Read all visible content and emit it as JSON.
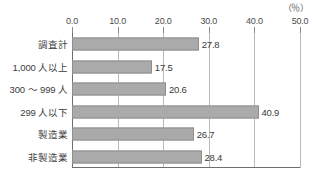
{
  "chart_data": {
    "type": "bar",
    "orientation": "horizontal",
    "title": "",
    "xlabel": "",
    "ylabel": "",
    "unit_label": "（％）",
    "xlim": [
      0.0,
      50.0
    ],
    "xticks": [
      "0.0",
      "10.0",
      "20.0",
      "30.0",
      "40.0",
      "50.0"
    ],
    "xtick_values": [
      0,
      10,
      20,
      30,
      40,
      50
    ],
    "grid": true,
    "legend": false,
    "categories": [
      "調査計",
      "1,000 人以上",
      "300 ～ 999 人",
      "299 人以下",
      "製造業",
      "非製造業"
    ],
    "values": [
      27.8,
      17.5,
      20.6,
      40.9,
      26.7,
      28.4
    ],
    "value_labels": [
      "27.8",
      "17.5",
      "20.6",
      "40.9",
      "26.7",
      "28.4"
    ],
    "bar_color": "#aaaaaa",
    "bar_border_color": "#8e8e8e",
    "axis_color": "#6e6e6e",
    "grid_color": "#b9b9b9",
    "text_color": "#3d3d3d"
  }
}
